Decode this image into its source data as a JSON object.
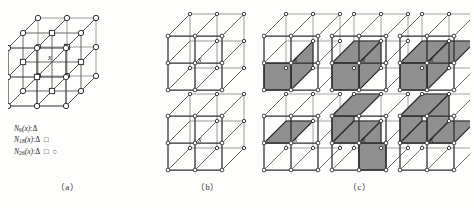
{
  "figure": {
    "background_color": "#fdfdfc",
    "ink_color": "#2b2b2b",
    "shade_color": "#8a8a8a",
    "center_label": "x"
  },
  "legend": {
    "lines": [
      {
        "name": "N",
        "subscript": "6",
        "arg": "(x)",
        "colon": ":",
        "glyphs": "Δ"
      },
      {
        "name": "N",
        "subscript": "18",
        "arg": "(x)",
        "colon": ":",
        "glyphs": "Δ □"
      },
      {
        "name": "N",
        "subscript": "26",
        "arg": "(x)",
        "colon": ":",
        "glyphs": "Δ □ ○"
      }
    ]
  },
  "panels": [
    {
      "id": "a",
      "caption": "（a）",
      "description": "3 by 3 by 3 point lattice with center voxel x",
      "center_label": "x",
      "marker_types": [
        "triangle",
        "square",
        "circle"
      ]
    },
    {
      "id": "b",
      "caption": "（b）",
      "description": "Two 2 by 2 by 2 cube grids, unshaded, center labelled x",
      "center_label": "x",
      "cubes": [
        {
          "row": 0,
          "col": 0,
          "shaded_faces": []
        },
        {
          "row": 1,
          "col": 0,
          "shaded_faces": []
        }
      ]
    },
    {
      "id": "c",
      "caption": "（c）",
      "description": "Six 2 by 2 by 2 cube grids with grey shaded internal faces, center labelled x",
      "center_label": "x",
      "cubes": [
        {
          "row": 0,
          "col": 0,
          "shaded_faces": [
            "front-lower-left"
          ]
        },
        {
          "row": 0,
          "col": 1,
          "shaded_faces": [
            "top-left",
            "front-lower-left"
          ]
        },
        {
          "row": 0,
          "col": 2,
          "shaded_faces": [
            "top-left",
            "top-right",
            "front-lower-left"
          ]
        },
        {
          "row": 1,
          "col": 0,
          "shaded_faces": [
            "mid-left"
          ]
        },
        {
          "row": 1,
          "col": 1,
          "shaded_faces": [
            "back-upper-left",
            "mid-left",
            "front-lower-right"
          ]
        },
        {
          "row": 1,
          "col": 2,
          "shaded_faces": [
            "back-upper-left",
            "mid-left",
            "mid-right"
          ]
        }
      ]
    }
  ]
}
